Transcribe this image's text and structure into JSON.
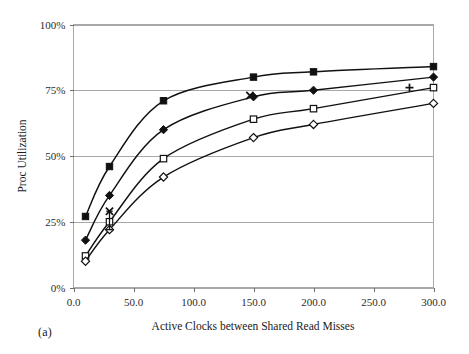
{
  "figure": {
    "caption": "(a)"
  },
  "chart_data": {
    "type": "line",
    "title": "",
    "xlabel": "Active Clocks between Shared Read Misses",
    "ylabel": "Proc Utilization",
    "xlim": [
      0,
      300
    ],
    "ylim": [
      0,
      100
    ],
    "grid": true,
    "legend": "none",
    "xticks": [
      0,
      50,
      100,
      150,
      200,
      250,
      300
    ],
    "xtick_labels": [
      "0.0",
      "50.0",
      "100.0",
      "150.0",
      "200.0",
      "250.0",
      "300.0"
    ],
    "yticks": [
      0,
      25,
      50,
      75,
      100
    ],
    "ytick_labels": [
      "0%",
      "25%",
      "50%",
      "75%",
      "100%"
    ],
    "series": [
      {
        "name": "series-filled-square",
        "marker": "filled-square",
        "x": [
          10,
          30,
          75,
          150,
          200,
          300
        ],
        "values": [
          27,
          46,
          71,
          80,
          82,
          84
        ]
      },
      {
        "name": "series-filled-diamond",
        "marker": "filled-diamond",
        "x": [
          10,
          30,
          75,
          150,
          200,
          300
        ],
        "values": [
          18,
          35,
          60,
          72.5,
          75,
          80
        ]
      },
      {
        "name": "series-open-square",
        "marker": "open-square",
        "x": [
          10,
          30,
          75,
          150,
          200,
          300
        ],
        "values": [
          12,
          25,
          49,
          64,
          68,
          76
        ]
      },
      {
        "name": "series-open-diamond",
        "marker": "open-diamond",
        "x": [
          10,
          30,
          75,
          150,
          200,
          300
        ],
        "values": [
          10,
          22,
          42,
          57,
          62,
          70
        ]
      }
    ],
    "annotations": [
      {
        "name": "x-marker-low",
        "marker": "cross-x",
        "x": 30,
        "y": 29
      },
      {
        "name": "x-marker-mid",
        "marker": "cross-x",
        "x": 147,
        "y": 73
      },
      {
        "name": "plus-marker",
        "marker": "plus",
        "x": 280,
        "y": 76
      }
    ],
    "error_bars": [
      {
        "name": "error-bar-low-x",
        "x": 30,
        "low": 22,
        "high": 29
      }
    ]
  }
}
